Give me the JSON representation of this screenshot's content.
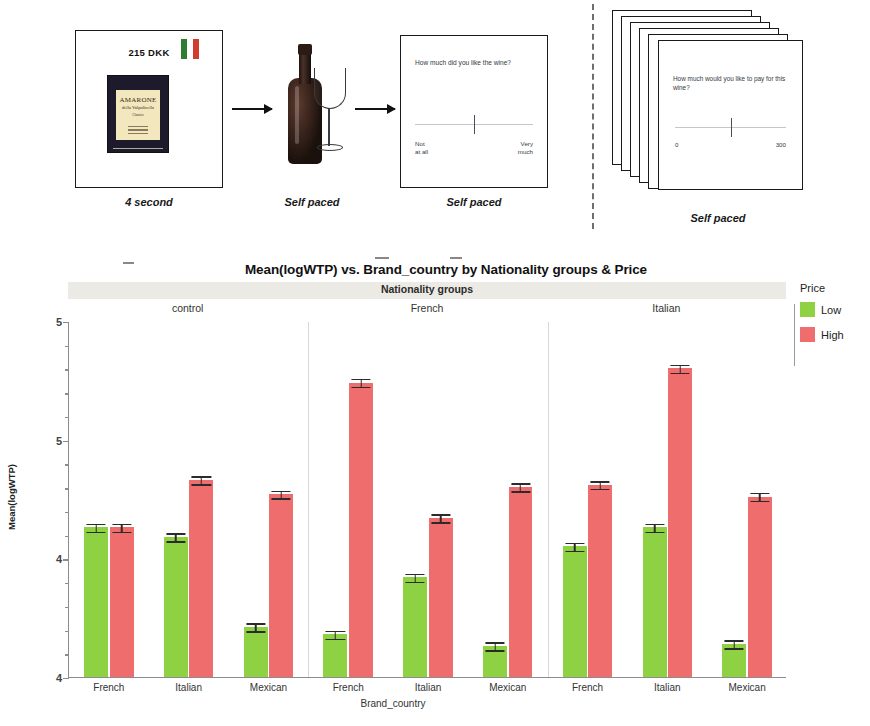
{
  "diagram": {
    "stimulus": {
      "price": "215 DKK",
      "flag_icon": "italian-flag",
      "wine_brand": "AMARONE",
      "wine_sub": "della Valpolicella",
      "wine_sub2": "Classico",
      "caption": "4 second"
    },
    "bottle": {
      "caption": "Self paced"
    },
    "liking": {
      "question": "How much did you like the wine?",
      "anchor_left": "Not\nat all",
      "anchor_left_line1": "Not",
      "anchor_left_line2": "at all",
      "anchor_right_line1": "Very",
      "anchor_right_line2": "much",
      "caption": "Self paced"
    },
    "wtp": {
      "question": "How much would you like to pay for this wine?",
      "scale_min": "0",
      "scale_max": "300",
      "caption": "Self paced"
    }
  },
  "chart_data": {
    "type": "bar",
    "title": "Mean(logWTP) vs. Brand_country by Nationality groups & Price",
    "panel_band_title": "Nationality groups",
    "panels": [
      "control",
      "French",
      "Italian"
    ],
    "categories": [
      "French",
      "Italian",
      "Mexican"
    ],
    "xlabel": "Brand_country",
    "ylabel": "Mean(logWTP)",
    "ylim": [
      4.0,
      5.5
    ],
    "yticks": [
      4.0,
      4.5,
      5.0,
      5.5
    ],
    "ytick_labels": [
      "4",
      "4",
      "5",
      "5"
    ],
    "grid": false,
    "legend_title": "Price",
    "legend_position": "right",
    "series": [
      {
        "name": "Low",
        "color": "#8ed143"
      },
      {
        "name": "High",
        "color": "#ef6d6d"
      }
    ],
    "groups": [
      {
        "panel": "control",
        "bars": [
          {
            "category": "French",
            "price": "Low",
            "value": 4.63,
            "error": 0.02
          },
          {
            "category": "French",
            "price": "High",
            "value": 4.63,
            "error": 0.02
          },
          {
            "category": "Italian",
            "price": "Low",
            "value": 4.59,
            "error": 0.02
          },
          {
            "category": "Italian",
            "price": "High",
            "value": 4.83,
            "error": 0.02
          },
          {
            "category": "Mexican",
            "price": "Low",
            "value": 4.21,
            "error": 0.02
          },
          {
            "category": "Mexican",
            "price": "High",
            "value": 4.77,
            "error": 0.02
          }
        ]
      },
      {
        "panel": "French",
        "bars": [
          {
            "category": "French",
            "price": "Low",
            "value": 4.18,
            "error": 0.02
          },
          {
            "category": "French",
            "price": "High",
            "value": 5.24,
            "error": 0.02
          },
          {
            "category": "Italian",
            "price": "Low",
            "value": 4.42,
            "error": 0.02
          },
          {
            "category": "Italian",
            "price": "High",
            "value": 4.67,
            "error": 0.02
          },
          {
            "category": "Mexican",
            "price": "Low",
            "value": 4.13,
            "error": 0.02
          },
          {
            "category": "Mexican",
            "price": "High",
            "value": 4.8,
            "error": 0.02
          }
        ]
      },
      {
        "panel": "Italian",
        "bars": [
          {
            "category": "French",
            "price": "Low",
            "value": 4.55,
            "error": 0.02
          },
          {
            "category": "French",
            "price": "High",
            "value": 4.81,
            "error": 0.02
          },
          {
            "category": "Italian",
            "price": "Low",
            "value": 4.63,
            "error": 0.02
          },
          {
            "category": "Italian",
            "price": "High",
            "value": 5.3,
            "error": 0.02
          },
          {
            "category": "Mexican",
            "price": "Low",
            "value": 4.14,
            "error": 0.02
          },
          {
            "category": "Mexican",
            "price": "High",
            "value": 4.76,
            "error": 0.02
          }
        ]
      }
    ]
  }
}
